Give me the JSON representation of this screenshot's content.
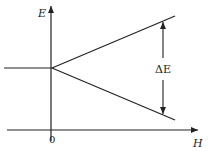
{
  "diagram": {
    "type": "energy-level splitting vs field",
    "labels": {
      "y_axis": "E",
      "x_axis": "H",
      "origin": "0",
      "gap": "ΔE"
    },
    "colors": {
      "line": "#222222",
      "background": "#ffffff"
    },
    "geometry": {
      "y_axis": {
        "x": 51,
        "y_top": 5,
        "y_bottom": 141
      },
      "x_axis": {
        "y": 130,
        "x_left": 7,
        "x_right": 199
      },
      "zero_field_level": {
        "x1": 4,
        "x2": 52,
        "y": 68
      },
      "upper_branch": {
        "x1": 52,
        "y1": 68,
        "x2": 175,
        "y2": 16
      },
      "lower_branch": {
        "x1": 52,
        "y1": 68,
        "x2": 175,
        "y2": 120
      },
      "delta_arrow": {
        "x": 163,
        "y_top": 21,
        "y_bottom": 115
      }
    }
  }
}
